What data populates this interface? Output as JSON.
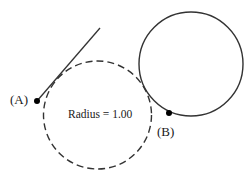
{
  "diagram": {
    "dashed_circle": {
      "cx": 97.5,
      "cy": 115,
      "r": 54,
      "style": "dashed",
      "stroke": "#333333"
    },
    "solid_circle": {
      "cx": 191,
      "cy": 64,
      "r": 52,
      "style": "solid",
      "stroke": "#333333"
    },
    "tangent_line": {
      "x1": 37,
      "y1": 101,
      "x2": 100,
      "y2": 28,
      "stroke": "#333333"
    },
    "point_a": {
      "x": 37,
      "y": 101,
      "label": "(A)"
    },
    "point_b": {
      "x": 169,
      "y": 113,
      "label": "(B)"
    },
    "radius_label": "Radius = 1.00"
  }
}
